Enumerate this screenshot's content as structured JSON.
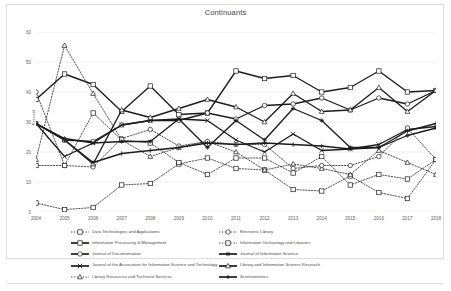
{
  "chart_data": {
    "type": "line",
    "title": "Continuants",
    "xlabel": "",
    "ylabel": "Per cent",
    "ylim": [
      0,
      60
    ],
    "yticks": [
      0,
      10,
      20,
      30,
      40,
      50,
      60
    ],
    "grid": true,
    "legend_position": "bottom",
    "x": [
      2004,
      2005,
      2006,
      2007,
      2008,
      2009,
      2010,
      2011,
      2012,
      2013,
      2014,
      2015,
      2016,
      2017,
      2018
    ],
    "categories": [
      "2004",
      "2005",
      "2006",
      "2007",
      "2008",
      "2009",
      "2010",
      "2011",
      "2012",
      "2013",
      "2014",
      "2015",
      "2016",
      "2017",
      "2018"
    ],
    "series": [
      {
        "name": "Data Technologies and Applications",
        "style": "dotted",
        "marker": "square",
        "values": [
          3.0,
          0.8,
          1.5,
          9.0,
          9.5,
          16.0,
          18.0,
          14.5,
          14.0,
          7.5,
          7.0,
          12.0,
          6.5,
          4.5,
          17.5
        ]
      },
      {
        "name": "Information Processing & Management",
        "style": "solid",
        "marker": "square",
        "values": [
          37.5,
          46.0,
          42.5,
          33.5,
          42.0,
          32.5,
          33.0,
          47.0,
          44.5,
          45.5,
          40.0,
          41.5,
          47.0,
          40.0,
          40.5
        ]
      },
      {
        "name": "Journal of Documentation",
        "style": "solid",
        "marker": "circle",
        "values": [
          29.5,
          24.0,
          23.5,
          29.0,
          30.5,
          30.5,
          33.0,
          31.0,
          35.5,
          36.0,
          38.0,
          34.0,
          38.0,
          36.0,
          40.5
        ]
      },
      {
        "name": "Journal of the Association for Information Science and Technology",
        "style": "solid",
        "marker": "cross",
        "values": [
          29.5,
          18.5,
          23.0,
          29.0,
          30.5,
          31.0,
          30.5,
          24.0,
          20.0,
          26.0,
          20.5,
          21.0,
          22.5,
          27.5,
          28.5
        ]
      },
      {
        "name": "Library Resources and Technical Services",
        "style": "dotted",
        "marker": "triangle",
        "values": [
          17.5,
          55.5,
          39.5,
          24.0,
          18.5,
          21.5,
          23.5,
          20.0,
          14.0,
          16.0,
          14.5,
          12.5,
          20.5,
          16.5,
          12.5
        ]
      },
      {
        "name": "Electronic Library",
        "style": "dotted",
        "marker": "circle",
        "values": [
          40.0,
          15.5,
          15.0,
          24.5,
          27.5,
          22.0,
          23.5,
          22.5,
          22.5,
          14.5,
          15.5,
          15.5,
          18.5,
          28.0,
          17.5
        ]
      },
      {
        "name": "Information Technology and Libraries",
        "style": "dotted",
        "marker": "square-open",
        "values": [
          15.5,
          15.5,
          33.0,
          24.0,
          23.0,
          16.5,
          12.5,
          18.0,
          18.0,
          13.0,
          18.5,
          9.0,
          12.5,
          11.0,
          17.5
        ]
      },
      {
        "name": "Journal of Information Science",
        "style": "solid",
        "marker": "star",
        "values": [
          29.5,
          24.5,
          23.0,
          23.5,
          23.5,
          31.0,
          21.5,
          30.5,
          24.0,
          34.5,
          30.5,
          21.5,
          21.5,
          25.5,
          28.0
        ]
      },
      {
        "name": "Library and Information Science Research",
        "style": "solid",
        "marker": "triangle",
        "values": [
          29.5,
          24.0,
          16.0,
          34.0,
          31.5,
          34.5,
          37.5,
          35.0,
          30.0,
          39.5,
          33.5,
          34.0,
          41.5,
          33.5,
          40.5
        ]
      },
      {
        "name": "Scientometrics",
        "style": "solid",
        "marker": "plus",
        "values": [
          29.5,
          24.0,
          16.5,
          19.5,
          20.5,
          21.5,
          23.0,
          22.5,
          23.0,
          22.5,
          22.0,
          21.0,
          21.5,
          27.0,
          29.5
        ]
      }
    ]
  },
  "axis": {
    "yticks": [
      "60",
      "50",
      "40",
      "30",
      "20",
      "10",
      "0"
    ],
    "xticks": [
      "2004",
      "2005",
      "2006",
      "2007",
      "2008",
      "2009",
      "2010",
      "2011",
      "2012",
      "2013",
      "2014",
      "2015",
      "2016",
      "2017",
      "2018"
    ]
  },
  "legend": {
    "left_column": [
      "Data Technologies and Applications",
      "Information Processing & Management",
      "Journal of Documentation",
      "Journal of the Association for Information Science and Technology",
      "Library Resources and Technical Services"
    ],
    "right_column": [
      "Electronic Library",
      "Information Technology and Libraries",
      "Journal of Information Science",
      "Library and Information Science Research",
      "Scientometrics"
    ]
  },
  "colors": {
    "line": "#1c1c1c",
    "grid": "#e4e4e4",
    "text": "#4a4a4a",
    "frame": "#dcdcdc"
  }
}
